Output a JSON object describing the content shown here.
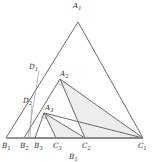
{
  "figure": {
    "caption_label": "B₁",
    "stroke_color": "#6b6b6b",
    "fill_color": "#ededed",
    "baseline_color": "#9a9a9a",
    "label_color": "#2b2b2b"
  },
  "labels": {
    "a1": "A",
    "a1_sub": "1",
    "a2": "A",
    "a2_sub": "2",
    "a3": "A",
    "a3_sub": "3",
    "b1": "B",
    "b1_sub": "1",
    "b2": "B",
    "b2_sub": "2",
    "b3": "B",
    "b3_sub": "3",
    "c1": "C",
    "c1_sub": "1",
    "c2": "C",
    "c2_sub": "2",
    "c3": "C",
    "c3_sub": "3",
    "d1": "D",
    "d1_sub": "1",
    "d2": "D",
    "d2_sub": "2",
    "caption": "B",
    "caption_sub": "1"
  },
  "geometry": {
    "points": {
      "A1": [
        78,
        22
      ],
      "A2": [
        60,
        79
      ],
      "A3": [
        44,
        113
      ],
      "B1": [
        6,
        138
      ],
      "B2": [
        24,
        138
      ],
      "B3": [
        35,
        138
      ],
      "C1": [
        143,
        138
      ],
      "C2": [
        85,
        138
      ],
      "C3": [
        56,
        138
      ],
      "D1": [
        39,
        71
      ],
      "D2": [
        32,
        105
      ]
    },
    "outer_triangle": [
      "A1",
      "B1",
      "C1"
    ],
    "second_triangle": [
      "A2",
      "B2",
      "C1"
    ],
    "third_triangle": [
      "A3",
      "B3",
      "C1"
    ],
    "shaded_regions": [
      [
        "A2",
        "C2",
        "C1"
      ],
      [
        "A3",
        "C3",
        "C2"
      ],
      [
        "B1",
        "B2",
        "C1"
      ]
    ],
    "cevians": [
      [
        "A1",
        "B1"
      ],
      [
        "A1",
        "C1"
      ],
      [
        "A2",
        "B2"
      ],
      [
        "A2",
        "C2"
      ],
      [
        "A2",
        "C1"
      ],
      [
        "A3",
        "B3"
      ],
      [
        "A3",
        "C3"
      ],
      [
        "A3",
        "C2"
      ],
      [
        "A3",
        "C1"
      ],
      [
        "D1",
        "B2"
      ],
      [
        "D2",
        "B3"
      ]
    ],
    "right_angle_markers": [
      [
        60,
        79
      ],
      [
        44,
        113
      ]
    ]
  }
}
